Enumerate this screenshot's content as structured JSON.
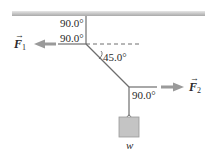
{
  "diagram": {
    "type": "force equilibrium / tension diagram",
    "ceiling": {
      "color": "#c8c8c8"
    },
    "rope_color": "#6e6e6e",
    "arrow_color": "#9a9a9a",
    "weight_box_color": "#c4c4c4",
    "angles": {
      "top_vertical": "90.0°",
      "upper_left": "90.0°",
      "diagonal": "45.0°",
      "lower_right": "90.0°"
    },
    "forces": {
      "f1": {
        "symbol": "F",
        "subscript": "1",
        "direction": "left"
      },
      "f2": {
        "symbol": "F",
        "subscript": "2",
        "direction": "right"
      }
    },
    "weight": {
      "label": "w"
    }
  }
}
